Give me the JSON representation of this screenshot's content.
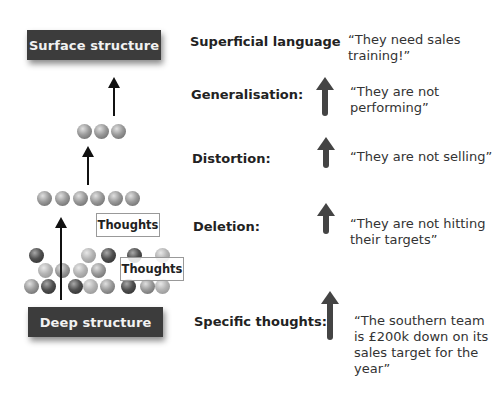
{
  "left_diagram": {
    "top_box": "Surface structure",
    "bottom_box": "Deep structure",
    "thoughts_box_1": "Thoughts",
    "thoughts_box_2": "Thoughts",
    "rows": {
      "top_row_count": 3,
      "middle_row_count": 6,
      "bottom_cluster_count": 24
    }
  },
  "levels": [
    {
      "label": "Superficial language",
      "quote": "“They need sales\ntraining!”",
      "arrow": false
    },
    {
      "label": "Generalisation:",
      "quote": "“They are not\nperforming”",
      "arrow": true
    },
    {
      "label": "Distortion:",
      "quote": "“They are not selling”",
      "arrow": true
    },
    {
      "label": "Deletion:",
      "quote": "“They are not hitting\ntheir targets”",
      "arrow": true
    },
    {
      "label": "Specific thoughts:",
      "quote": "“The southern team\nis £200k down on its\nsales target for the\nyear”",
      "arrow": true
    }
  ],
  "colors": {
    "box_bg": "#3c3c3c",
    "box_text": "#f2f2f2",
    "arrow": "#444444"
  }
}
